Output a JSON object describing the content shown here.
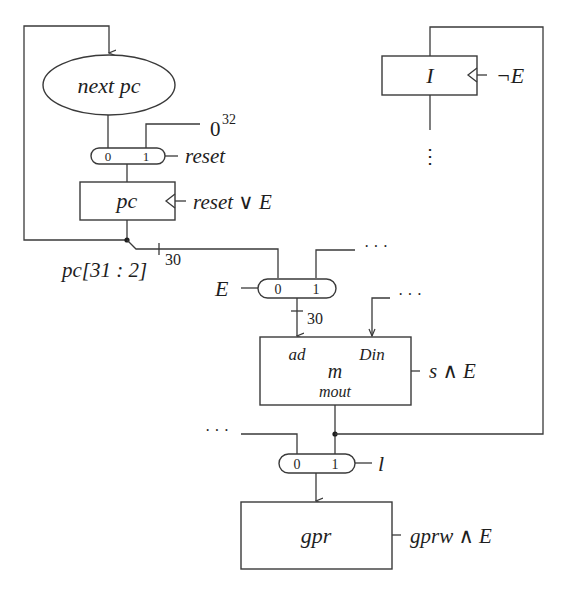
{
  "diagram": {
    "components": {
      "nextpc": {
        "label": "next pc"
      },
      "pc": {
        "label": "pc",
        "clock": "reset ∨ E"
      },
      "instr_reg": {
        "label": "I",
        "clock": "¬E"
      },
      "memory": {
        "label": "m",
        "port_ad": "ad",
        "port_din": "Din",
        "port_mout": "mout",
        "write": "s ∧ E"
      },
      "gpr": {
        "label": "gpr",
        "write": "gprw ∧ E"
      }
    },
    "muxes": {
      "reset_mux": {
        "in0": "0",
        "in1": "1",
        "select": "reset",
        "const_in1": "0",
        "const_exp": "32"
      },
      "addr_mux": {
        "in0": "0",
        "in1": "1",
        "select": "E",
        "in1_src": "· · ·",
        "bus_width": "30"
      },
      "load_mux": {
        "in0": "0",
        "in1": "1",
        "select": "l",
        "in0_src": "· · ·"
      }
    },
    "signals": {
      "pc_slice": "pc[31 : 2]",
      "pc_slice_width": "30",
      "din_src": "· · ·",
      "ir_out": "⋮"
    }
  }
}
